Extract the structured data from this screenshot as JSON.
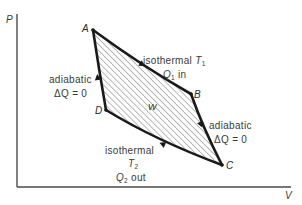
{
  "diagram": {
    "axes": {
      "y_label": "P",
      "x_label": "V"
    },
    "points": {
      "A": "A",
      "B": "B",
      "C": "C",
      "D": "D"
    },
    "work_label": "W",
    "processes": {
      "ab": {
        "line1_text": "isothermal ",
        "line1_var": "T",
        "line1_sub": "1",
        "line2_var": "Q",
        "line2_sub": "1",
        "line2_text": " in"
      },
      "bc": {
        "line1": "adiabatic",
        "line2": "ΔQ = 0"
      },
      "cd": {
        "line1": "isothermal",
        "line2_var": "T",
        "line2_sub": "2",
        "line3_var": "Q",
        "line3_sub": "2",
        "line3_text": " out"
      },
      "da": {
        "line1": "adiabatic",
        "line2": "ΔQ = 0"
      }
    },
    "colors": {
      "line": "#1a1a1a",
      "axis": "#4a4a4a",
      "hatch": "#8c8c8c",
      "text": "#3a3a3a"
    }
  }
}
